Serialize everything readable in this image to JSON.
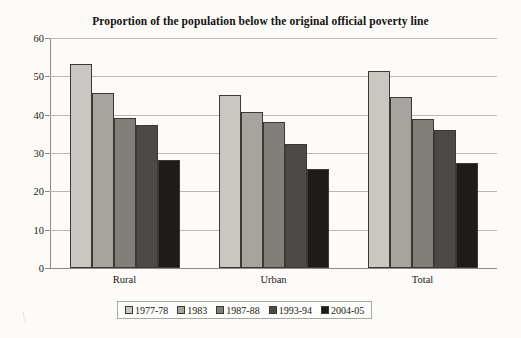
{
  "chart_data": {
    "type": "bar",
    "title": "Proportion of the population below the original official poverty line",
    "xlabel": "",
    "ylabel": "",
    "ylim": [
      0,
      60
    ],
    "yticks": [
      0,
      10,
      20,
      30,
      40,
      50,
      60
    ],
    "grid": true,
    "legend_position": "bottom",
    "categories": [
      "Rural",
      "Urban",
      "Total"
    ],
    "series": [
      {
        "name": "1977-78",
        "color": "#c9c7c2",
        "values": [
          53.1,
          45.2,
          51.3
        ]
      },
      {
        "name": "1983",
        "color": "#a6a49f",
        "values": [
          45.7,
          40.8,
          44.5
        ]
      },
      {
        "name": "1987-88",
        "color": "#817f7a",
        "values": [
          39.1,
          38.2,
          38.9
        ]
      },
      {
        "name": "1993-94",
        "color": "#4c4a46",
        "values": [
          37.3,
          32.4,
          36.0
        ]
      },
      {
        "name": "2004-05",
        "color": "#1d1c19",
        "values": [
          28.3,
          25.7,
          27.5
        ]
      }
    ]
  },
  "legend": {
    "items": [
      {
        "label": "1977-78"
      },
      {
        "label": "1983"
      },
      {
        "label": "1987-88"
      },
      {
        "label": "1993-94"
      },
      {
        "label": "2004-05"
      }
    ]
  },
  "artifact": {
    "mark": "\\"
  }
}
